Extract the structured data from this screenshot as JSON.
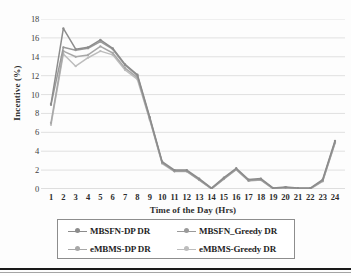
{
  "chart_data": {
    "type": "line",
    "title": "",
    "xlabel": "Time of the Day (Hrs)",
    "ylabel": "Incentive (%)",
    "xlim": [
      1,
      24
    ],
    "ylim": [
      0,
      18
    ],
    "ytick_step": 2,
    "grid": "horizontal",
    "legend_position": "bottom",
    "categories": [
      1,
      2,
      3,
      4,
      5,
      6,
      7,
      8,
      9,
      10,
      11,
      12,
      13,
      14,
      15,
      16,
      17,
      18,
      19,
      20,
      21,
      22,
      23,
      24
    ],
    "x_tick_labels": [
      "1",
      "2",
      "3",
      "4",
      "5",
      "6",
      "7",
      "8",
      "9",
      "10",
      "11",
      "12",
      "13",
      "14",
      "15",
      "16",
      "17",
      "18",
      "19",
      "20",
      "21",
      "22",
      "23",
      "24"
    ],
    "y_tick_labels": [
      "0",
      "2",
      "4",
      "6",
      "8",
      "10",
      "12",
      "14",
      "16",
      "18"
    ],
    "series": [
      {
        "name": "MBSFN-DP DR",
        "color": "#8c8c8c",
        "values": [
          9.0,
          17.0,
          14.8,
          15.0,
          15.8,
          14.9,
          13.2,
          12.1,
          7.6,
          2.9,
          2.0,
          2.0,
          1.1,
          0.1,
          1.2,
          2.2,
          1.0,
          1.1,
          0.1,
          0.2,
          0.1,
          0.1,
          1.0,
          5.1
        ]
      },
      {
        "name": "MBSFN_Greedy DR",
        "color": "#9a9a9a",
        "values": [
          8.9,
          15.0,
          14.7,
          14.9,
          15.6,
          14.8,
          13.1,
          12.0,
          7.5,
          2.8,
          1.9,
          1.9,
          1.0,
          0.05,
          1.1,
          2.1,
          0.9,
          1.0,
          0.05,
          0.15,
          0.05,
          0.05,
          0.9,
          5.0
        ]
      },
      {
        "name": "eMBMS-DP DR",
        "color": "#a8a8a8",
        "values": [
          7.0,
          14.6,
          14.0,
          14.2,
          15.1,
          14.4,
          12.8,
          11.8,
          7.4,
          2.8,
          1.9,
          1.9,
          1.0,
          0.05,
          1.1,
          2.1,
          0.9,
          1.0,
          0.05,
          0.15,
          0.05,
          0.05,
          0.85,
          4.9
        ]
      },
      {
        "name": "eMBMS-Greedy DR",
        "color": "#bdbdbd",
        "values": [
          6.8,
          14.3,
          13.0,
          13.9,
          14.6,
          14.2,
          12.6,
          11.6,
          7.3,
          2.7,
          1.85,
          1.85,
          0.95,
          0.0,
          1.05,
          2.05,
          0.85,
          0.95,
          0.0,
          0.1,
          0.0,
          0.0,
          0.8,
          4.85
        ]
      }
    ]
  },
  "legend": {
    "items": [
      {
        "label": "MBSFN-DP DR",
        "color": "#8c8c8c"
      },
      {
        "label": "MBSFN_Greedy DR",
        "color": "#9a9a9a"
      },
      {
        "label": "eMBMS-DP DR",
        "color": "#a8a8a8"
      },
      {
        "label": "eMBMS-Greedy DR",
        "color": "#bdbdbd"
      }
    ]
  },
  "axes": {
    "x_title": "Time of the Day (Hrs)",
    "y_title": "Incentive (%)"
  },
  "colors": {
    "gridline": "#d9d9d9",
    "axis_line": "#bfbfbf",
    "text": "#2b2b2b",
    "legend_border": "#8d8d8d",
    "page_rule": "#1a1a1a"
  }
}
